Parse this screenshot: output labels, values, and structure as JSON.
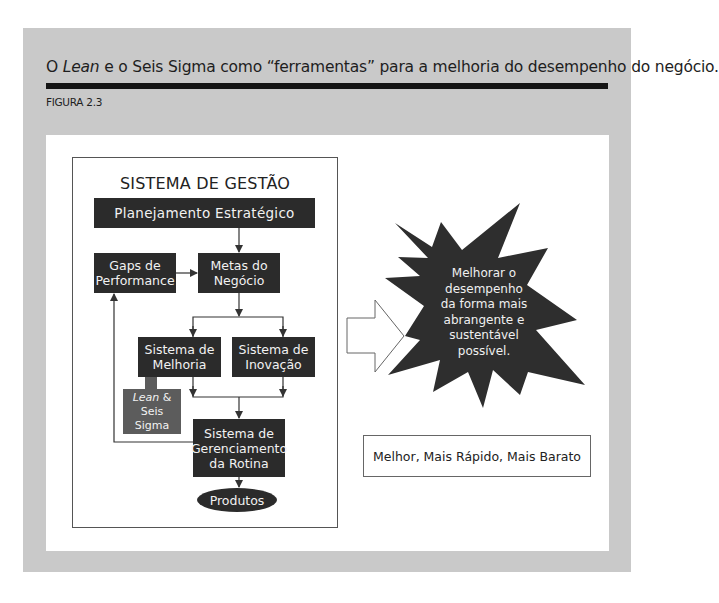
{
  "header": {
    "title_prefix": "O ",
    "title_italic": "Lean",
    "title_suffix": " e o Seis Sigma como “ferramentas” para a melhoria do desempenho do negócio.",
    "figure_label": "FIGURA 2.3"
  },
  "diagram": {
    "system_title": "SISTEMA DE GESTÃO",
    "nodes": {
      "planejamento": "Planejamento Estratégico",
      "gaps_line1": "Gaps de",
      "gaps_line2": "Performance",
      "metas_line1": "Metas do",
      "metas_line2": "Negócio",
      "melhoria_line1": "Sistema de",
      "melhoria_line2": "Melhoria",
      "inovacao_line1": "Sistema de",
      "inovacao_line2": "Inovação",
      "lean_line1_italic": "Lean",
      "lean_line1_suffix": " &",
      "lean_line2": "Seis Sigma",
      "rotina_line1": "Sistema de",
      "rotina_line2": "Gerenciamento",
      "rotina_line3": "da Rotina",
      "produtos": "Produtos"
    }
  },
  "outcome": {
    "star_lines": [
      "Melhorar o",
      "desempenho",
      "da forma mais",
      "abrangente e",
      "sustentável",
      "possível."
    ],
    "motto": "Melhor, Mais Rápido, Mais Barato"
  },
  "colors": {
    "frame_gray": "#c9c9c9",
    "node_dark": "#2b2b2b",
    "lean_gray": "#5c5c5c",
    "star_dark": "#2e2e2e"
  }
}
